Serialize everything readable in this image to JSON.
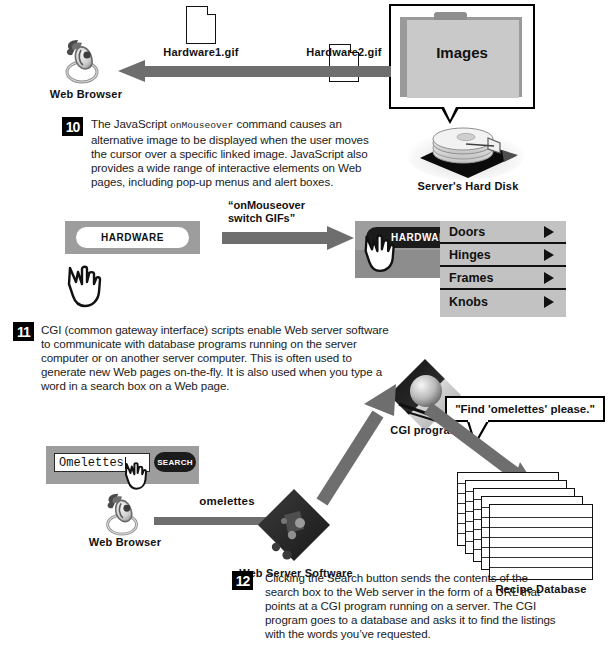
{
  "colors": {
    "arrow_gray": "#6e6e6e",
    "panel_gray": "#9d9d9d",
    "menu_gray": "#c2c2c2",
    "folder_gray": "#c9c9c9",
    "ink": "#111111",
    "paper": "#ffffff"
  },
  "step10": {
    "number": "10",
    "text_before_mono": "The JavaScript ",
    "mono_token": "onMouseover",
    "text_after_mono": " command causes an alternative image to be displayed when the user moves the cursor over a specific linked image. JavaScript also provides a wide range of interactive elements on Web pages, including pop-up menus and alert boxes."
  },
  "step11": {
    "number": "11",
    "text": "CGI (common gateway interface) scripts enable Web server software to communicate with database programs running on the server computer or on another server computer. This is often used to generate new Web pages on-the-fly. It is also used when you type a word in a search box on a Web page."
  },
  "step12": {
    "number": "12",
    "text": "Clicking the Search button sends the contents of the search box to the Web server in the form of a URL that points at a CGI program running on a server. The CGI program goes to a database and asks it to find the listings with the words you’ve requested."
  },
  "top_row": {
    "web_browser_label": "Web Browser",
    "gif1_label": "Hardware1.gif",
    "gif2_label": "Hardware2.gif",
    "folder_label": "Images",
    "hard_disk_label": "Server's Hard Disk"
  },
  "rollover": {
    "button_label": "HARDWARE",
    "active_button_label": "HARDWARE",
    "arrow_quote_line1": "“onMouseover",
    "arrow_quote_line2": "switch GIFs”",
    "menu_items": [
      {
        "label": "Doors"
      },
      {
        "label": "Hinges"
      },
      {
        "label": "Frames"
      },
      {
        "label": "Knobs"
      }
    ]
  },
  "cgi_flow": {
    "search_value": "Omelettes",
    "search_button_label": "SEARCH",
    "web_browser_label": "Web Browser",
    "query_arrow_label": "omelettes",
    "web_server_label": "Web Server Software",
    "cgi_program_label": "CGI program",
    "bubble_text": "\"Find 'omelettes' please.\"",
    "database_label": "Recipe Database"
  },
  "icons": {
    "document": "document-icon",
    "folder": "folder-icon",
    "hard_disk": "hard-disk-icon",
    "web_browser": "web-browser-globe-icon",
    "hand_cursor": "hand-pointer-icon",
    "diamond_server": "server-diamond-icon",
    "diamond_cgi": "cgi-diamond-icon",
    "card_stack": "database-cards-icon",
    "menu_arrow": "triangle-right-icon"
  }
}
